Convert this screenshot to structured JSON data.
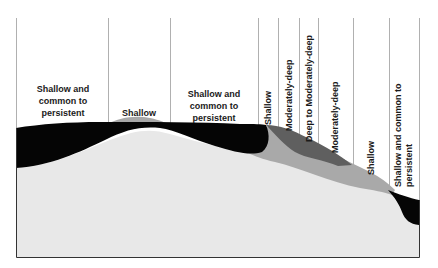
{
  "diagram": {
    "type": "terrain cross-section",
    "zones": [
      {
        "label": "Shallow and\ncommon to\npersistent",
        "orientation": "horizontal"
      },
      {
        "label": "Shallow",
        "orientation": "horizontal"
      },
      {
        "label": "Shallow and\ncommon to\npersistent",
        "orientation": "horizontal"
      },
      {
        "label": "Shallow",
        "orientation": "vertical"
      },
      {
        "label": "Moderately-deep",
        "orientation": "vertical"
      },
      {
        "label": "Deep to Moderately-deep",
        "orientation": "vertical"
      },
      {
        "label": "Moderately-deep",
        "orientation": "vertical"
      },
      {
        "label": "Shallow",
        "orientation": "vertical"
      },
      {
        "label": "Shallow and common to\npersistent",
        "orientation": "vertical"
      }
    ],
    "colors": {
      "black_layer": "#050505",
      "light_base": "#e8e8e8",
      "mid_grey": "#a9a9a9",
      "dark_grey": "#5f5f5f",
      "mound_grey": "#a8a8a8",
      "divider": "#b0b0b0",
      "frame": "#333333"
    }
  }
}
